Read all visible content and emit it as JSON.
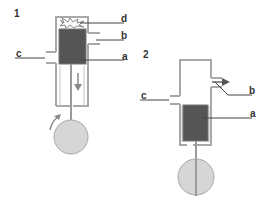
{
  "diagram": {
    "panels": [
      {
        "number": "1",
        "labels": {
          "a": "a",
          "b": "b",
          "c": "c",
          "d": "d"
        }
      },
      {
        "number": "2",
        "labels": {
          "a": "a",
          "b": "b",
          "c": "c"
        }
      }
    ],
    "colors": {
      "cylinder_line": "#a8a8a8",
      "piston": "#555555",
      "flywheel": "#d6d6d6",
      "leader": "#444444",
      "arrow": "#888888"
    }
  }
}
